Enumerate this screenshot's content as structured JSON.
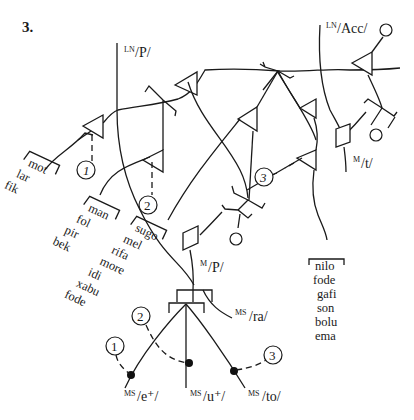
{
  "figure": {
    "number": "3."
  },
  "labels": {
    "ln_p": {
      "prefix": "LN",
      "text": "/P/"
    },
    "ln_acc": {
      "prefix": "LN",
      "text": "/Acc/"
    },
    "m_t": {
      "prefix": "M",
      "text": "/t/"
    },
    "m_p": {
      "prefix": "M",
      "text": "/P/"
    },
    "ms_ra": {
      "prefix": "MS",
      "text": "/ra/"
    },
    "ms_e": {
      "prefix": "MS",
      "text": "/e⁺/"
    },
    "ms_u": {
      "prefix": "MS",
      "text": "/u⁺/"
    },
    "ms_to": {
      "prefix": "MS",
      "text": "/to/"
    }
  },
  "circled_numbers": {
    "upper_1": "1",
    "upper_2": "2",
    "upper_3": "3",
    "lower_1": "1",
    "lower_2": "2",
    "lower_3": "3"
  },
  "word_lists": {
    "list_a": [
      "mot",
      "lar",
      "fik"
    ],
    "list_b": [
      "man",
      "fol",
      "pir",
      "bek"
    ],
    "list_c": [
      "sugo",
      "mel",
      "rifa",
      "more",
      "idi",
      "xabu",
      "fode"
    ],
    "list_d": [
      "nilo",
      "fode",
      "gafi",
      "son",
      "bolu",
      "ema"
    ]
  },
  "colors": {
    "ink": "#1a1a1a",
    "background": "#ffffff"
  }
}
